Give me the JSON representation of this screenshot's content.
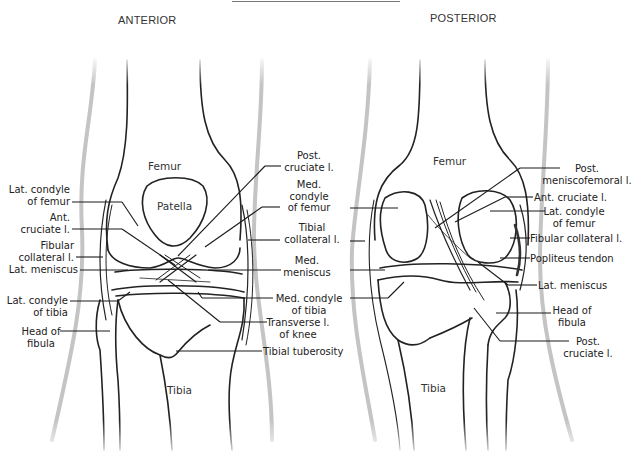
{
  "diagram": {
    "views": {
      "anterior": {
        "title": "ANTERIOR",
        "bones": {
          "femur": "Femur",
          "patella": "Patella",
          "tibia": "Tibia"
        },
        "labels_left": [
          {
            "line1": "Lat. condyle",
            "line2": "of femur"
          },
          {
            "line1": "Ant.",
            "line2": "cruciate l."
          },
          {
            "line1": "Fibular",
            "line2": "collateral l."
          },
          {
            "line1": "Lat. meniscus",
            "line2": ""
          },
          {
            "line1": "Lat. condyle",
            "line2": "of tibia"
          },
          {
            "line1": "Head of",
            "line2": "fibula"
          }
        ],
        "labels_right": [
          {
            "line1": "Post.",
            "line2": "cruciate l.",
            "line3": ""
          },
          {
            "line1": "Med.",
            "line2": "condyle",
            "line3": "of femur"
          },
          {
            "line1": "Tibial",
            "line2": "collateral l.",
            "line3": ""
          },
          {
            "line1": "Med.",
            "line2": "meniscus",
            "line3": ""
          },
          {
            "line1": "Med. condyle",
            "line2": "of tibia",
            "line3": ""
          },
          {
            "line1": "Transverse l.",
            "line2": "of knee",
            "line3": ""
          },
          {
            "line1": "Tibial tuberosity",
            "line2": "",
            "line3": ""
          }
        ]
      },
      "posterior": {
        "title": "POSTERIOR",
        "bones": {
          "femur": "Femur",
          "tibia": "Tibia"
        },
        "labels_right": [
          {
            "line1": "Post.",
            "line2": "meniscofemoral l."
          },
          {
            "line1": "Ant. cruciate l.",
            "line2": ""
          },
          {
            "line1": "Lat. condyle",
            "line2": "of femur"
          },
          {
            "line1": "Fibular collateral l.",
            "line2": ""
          },
          {
            "line1": "Popliteus tendon",
            "line2": ""
          },
          {
            "line1": "Lat. meniscus",
            "line2": ""
          },
          {
            "line1": "Head of",
            "line2": "fibula"
          },
          {
            "line1": "Post.",
            "line2": "cruciate l."
          }
        ]
      }
    },
    "colors": {
      "ink": "#222222",
      "skin_outline": "#bdbdbd",
      "leader": "#1a1a1a"
    }
  }
}
